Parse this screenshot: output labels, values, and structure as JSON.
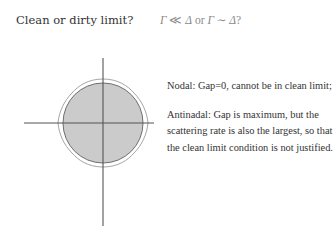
{
  "header": {
    "question": "Clean or dirty limit?",
    "formula": {
      "part1_left": "Γ",
      "part1_op": " ≪ ",
      "part1_right": "Δ",
      "joiner": " or ",
      "part2_left": "Γ",
      "part2_op": " ∼ ",
      "part2_right": "Δ",
      "suffix": "?"
    }
  },
  "figure": {
    "colors": {
      "fill": "#c8c8c8",
      "circle_stroke": "#6e6e6e",
      "contour_stroke": "#9a9a9a",
      "axis": "#555555"
    }
  },
  "notes": [
    {
      "label": "Nodal",
      "text": "Nodal: Gap=0, cannot be in clean limit;"
    },
    {
      "label": "Antinodal",
      "text": "Antinadal: Gap is maximum, but the scattering rate is also the largest, so that the clean limit condition is not justified."
    }
  ]
}
